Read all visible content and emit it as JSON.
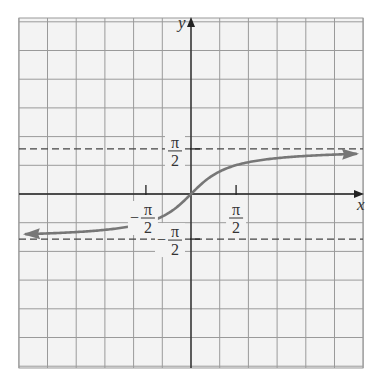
{
  "chart_data": {
    "type": "line",
    "title": "",
    "function": "y = arctan(x)",
    "xlabel": "x",
    "ylabel": "y",
    "xlim": [
      -5.5,
      5.5
    ],
    "ylim": [
      -6.0,
      6.0
    ],
    "grid": true,
    "grid_unit": 1,
    "x_tick_labels": [
      {
        "value": -1.5708,
        "num": "π",
        "den": "2",
        "sign": "−"
      },
      {
        "value": 1.5708,
        "num": "π",
        "den": "2",
        "sign": ""
      }
    ],
    "y_tick_labels": [
      {
        "value": 1.5708,
        "num": "π",
        "den": "2",
        "sign": ""
      },
      {
        "value": -1.5708,
        "num": "π",
        "den": "2",
        "sign": "−"
      }
    ],
    "asymptotes": [
      {
        "y": 1.5708,
        "style": "dashed",
        "label": "π/2"
      },
      {
        "y": -1.5708,
        "style": "dashed",
        "label": "−π/2"
      }
    ],
    "series": [
      {
        "name": "arctan(x)",
        "color": "#777777",
        "arrows": "both",
        "x": [
          -5.9,
          -5,
          -4,
          -3,
          -2,
          -1.5,
          -1,
          -0.5,
          0,
          0.5,
          1,
          1.5,
          2,
          3,
          4,
          5,
          5.8
        ],
        "values": [
          -1.403,
          -1.373,
          -1.326,
          -1.249,
          -1.107,
          -0.983,
          -0.785,
          -0.464,
          0,
          0.464,
          0.785,
          0.983,
          1.107,
          1.249,
          1.326,
          1.373,
          1.4
        ]
      }
    ]
  },
  "colors": {
    "grid": "#9a9a9a",
    "axis": "#222222",
    "curve": "#777777",
    "asymptote": "#444444",
    "background": "#f3f3f3"
  },
  "labels": {
    "x_axis": "x",
    "y_axis": "y",
    "pi": "π",
    "two": "2",
    "minus": "−"
  }
}
